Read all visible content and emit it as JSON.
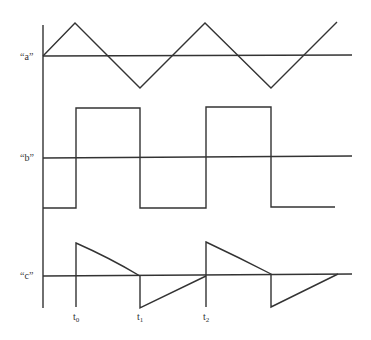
{
  "diagram": {
    "signals": [
      {
        "id": "a",
        "label": "“a”",
        "shape": "triangle wave"
      },
      {
        "id": "b",
        "label": "“b”",
        "shape": "square wave"
      },
      {
        "id": "c",
        "label": "“c”",
        "shape": "decaying spikes (differentiated)"
      }
    ],
    "time_markers": [
      {
        "label": "t",
        "sub": "0"
      },
      {
        "label": "t",
        "sub": "1"
      },
      {
        "label": "t",
        "sub": "2"
      }
    ],
    "colors": {
      "line": "#333333",
      "background": "#ffffff"
    }
  }
}
